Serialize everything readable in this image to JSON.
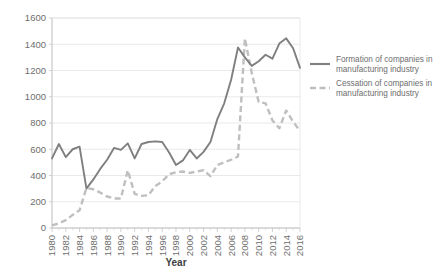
{
  "chart_data": {
    "type": "line",
    "title": "",
    "xlabel": "Year",
    "ylabel": "",
    "xlim": [
      1980,
      2016
    ],
    "ylim": [
      0,
      1600
    ],
    "ytick_step": 200,
    "xtick_step": 2,
    "grid": "horizontal",
    "legend_position": "right",
    "yticks": [
      "0",
      "200",
      "400",
      "600",
      "800",
      "1000",
      "1200",
      "1400",
      "1600"
    ],
    "xticks": [
      "1980",
      "1982",
      "1984",
      "1986",
      "1988",
      "1990",
      "1992",
      "1994",
      "1996",
      "1998",
      "2000",
      "2002",
      "2004",
      "2006",
      "2008",
      "2010",
      "2012",
      "2014",
      "2016"
    ],
    "x": [
      1980,
      1981,
      1982,
      1983,
      1984,
      1985,
      1986,
      1987,
      1988,
      1989,
      1990,
      1991,
      1992,
      1993,
      1994,
      1995,
      1996,
      1997,
      1998,
      1999,
      2000,
      2001,
      2002,
      2003,
      2004,
      2005,
      2006,
      2007,
      2008,
      2009,
      2010,
      2011,
      2012,
      2013,
      2014,
      2015,
      2016
    ],
    "series": [
      {
        "name": "Formation of companies in manufacturing industry",
        "style": "solid",
        "color": "#7f7f7f",
        "values": [
          530,
          640,
          540,
          600,
          620,
          300,
          370,
          450,
          520,
          610,
          595,
          645,
          530,
          640,
          655,
          660,
          655,
          575,
          480,
          515,
          595,
          530,
          580,
          655,
          830,
          950,
          1130,
          1375,
          1300,
          1235,
          1270,
          1320,
          1290,
          1405,
          1445,
          1370,
          1220
        ]
      },
      {
        "name": "Cessation of companies in manufacturing industry",
        "style": "dashed",
        "color": "#bfbfbf",
        "values": [
          20,
          35,
          60,
          100,
          135,
          305,
          295,
          270,
          240,
          225,
          225,
          440,
          260,
          245,
          250,
          320,
          355,
          410,
          425,
          430,
          420,
          430,
          440,
          395,
          480,
          500,
          520,
          545,
          1445,
          1180,
          960,
          950,
          820,
          760,
          895,
          810,
          740
        ]
      }
    ]
  },
  "legend": {
    "items": [
      {
        "label_line1": "Formation of companies in",
        "label_line2": "manufacturing industry",
        "style": "solid"
      },
      {
        "label_line1": "Cessation of companies in",
        "label_line2": "manufacturing industry",
        "style": "dashed"
      }
    ]
  },
  "axis": {
    "x_title": "Year"
  },
  "colors": {
    "formation": "#7f7f7f",
    "cessation": "#bfbfbf",
    "grid": "#e0e0e0",
    "text": "#6e6e6e"
  }
}
